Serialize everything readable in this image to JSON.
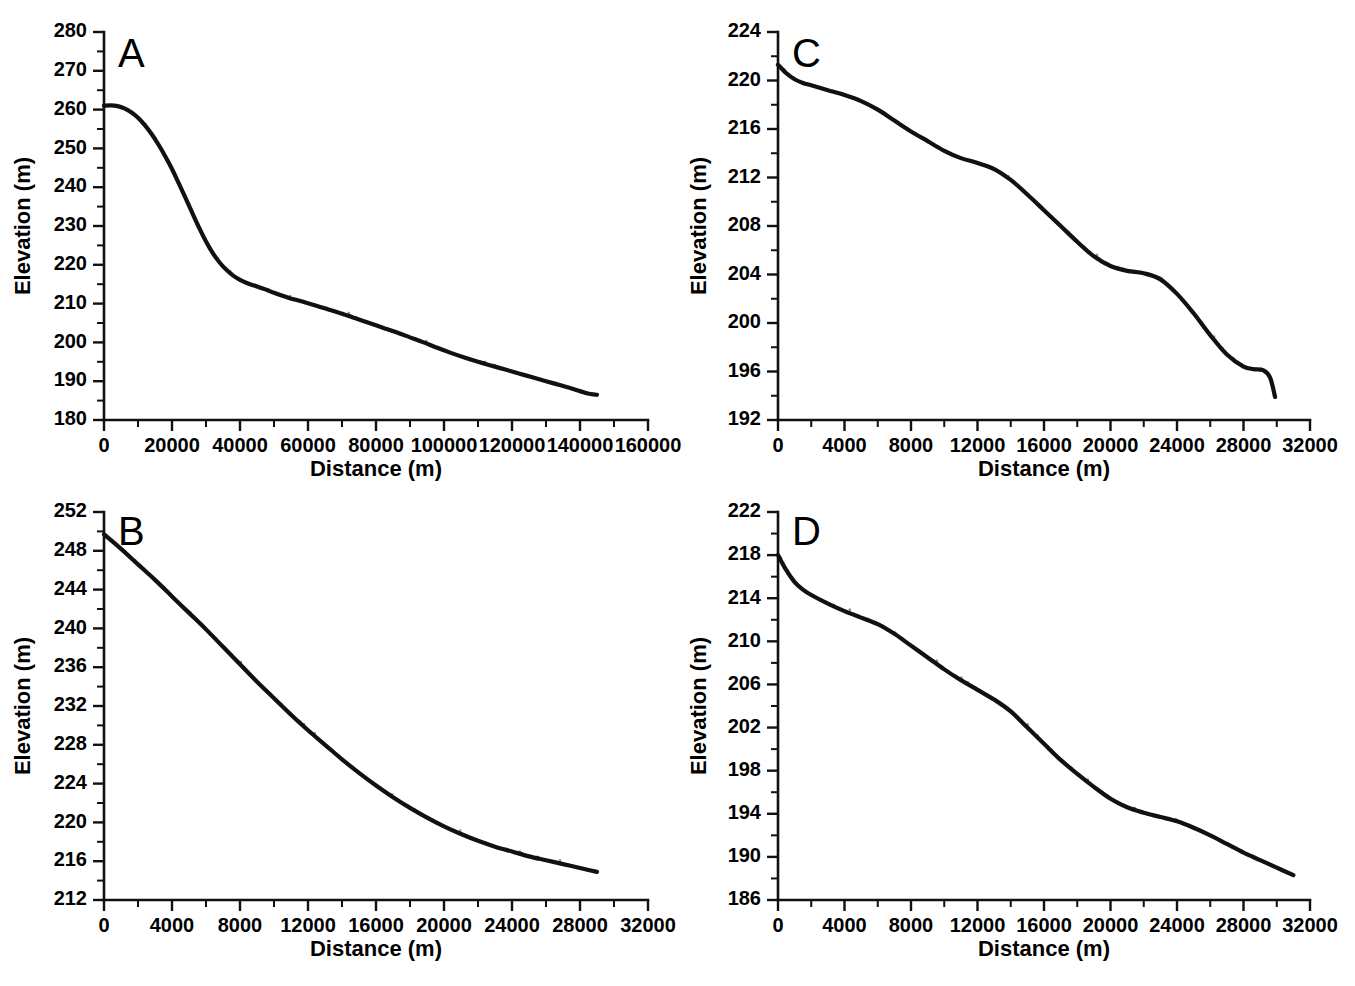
{
  "figure": {
    "panel_count": 4,
    "background_color": "#ffffff",
    "line_color": "#111111",
    "raw_trace_color": "#8a8a8a",
    "caption_partial": ""
  },
  "chart_data": [
    {
      "id": "A",
      "panel_letter": "A",
      "type": "line",
      "title": "",
      "xlabel": "Distance (m)",
      "ylabel": "Elevation (m)",
      "xlim": [
        0,
        160000
      ],
      "ylim": [
        180,
        280
      ],
      "xticks": [
        0,
        20000,
        40000,
        60000,
        80000,
        100000,
        120000,
        140000,
        160000
      ],
      "xtick_labels": [
        "0",
        "20000",
        "40000",
        "60000",
        "80000",
        "100000",
        "120000",
        "140000",
        "160000"
      ],
      "x_minor_step": 10000,
      "yticks": [
        180,
        190,
        200,
        210,
        220,
        230,
        240,
        250,
        260,
        270,
        280
      ],
      "ytick_labels": [
        "180",
        "190",
        "200",
        "210",
        "220",
        "230",
        "240",
        "250",
        "260",
        "270",
        "280"
      ],
      "y_minor_step": 5,
      "grid": false,
      "legend": "none",
      "series": [
        {
          "name": "smoothed longitudinal profile",
          "x": [
            0,
            2000,
            4000,
            6000,
            8000,
            10000,
            12000,
            14000,
            16000,
            18000,
            20000,
            22000,
            24000,
            26000,
            28000,
            30000,
            32000,
            34000,
            36000,
            38000,
            40000,
            42000,
            44000,
            46000,
            48000,
            50000,
            54000,
            58000,
            62000,
            66000,
            70000,
            74000,
            78000,
            82000,
            86000,
            90000,
            94000,
            98000,
            102000,
            106000,
            110000,
            114000,
            118000,
            122000,
            126000,
            130000,
            134000,
            138000,
            142000,
            145000
          ],
          "y": [
            261.0,
            261.1,
            260.9,
            260.3,
            259.3,
            257.9,
            256.0,
            253.7,
            251.0,
            248.0,
            244.7,
            241.0,
            237.2,
            233.3,
            229.5,
            226.0,
            223.0,
            220.6,
            218.7,
            217.2,
            216.1,
            215.3,
            214.7,
            214.1,
            213.5,
            212.8,
            211.6,
            210.6,
            209.6,
            208.5,
            207.4,
            206.2,
            205.0,
            203.8,
            202.6,
            201.3,
            200.0,
            198.6,
            197.3,
            196.1,
            195.0,
            194.0,
            193.0,
            192.0,
            191.0,
            190.0,
            189.0,
            188.0,
            186.9,
            186.5
          ]
        }
      ]
    },
    {
      "id": "B",
      "panel_letter": "B",
      "type": "line",
      "title": "",
      "xlabel": "Distance (m)",
      "ylabel": "Elevation (m)",
      "xlim": [
        0,
        32000
      ],
      "ylim": [
        212,
        252
      ],
      "xticks": [
        0,
        4000,
        8000,
        12000,
        16000,
        20000,
        24000,
        28000,
        32000
      ],
      "xtick_labels": [
        "0",
        "4000",
        "8000",
        "12000",
        "16000",
        "20000",
        "24000",
        "28000",
        "32000"
      ],
      "x_minor_step": 2000,
      "yticks": [
        212,
        216,
        220,
        224,
        228,
        232,
        236,
        240,
        244,
        248,
        252
      ],
      "ytick_labels": [
        "212",
        "216",
        "220",
        "224",
        "228",
        "232",
        "236",
        "240",
        "244",
        "248",
        "252"
      ],
      "y_minor_step": 2,
      "grid": false,
      "legend": "none",
      "series": [
        {
          "name": "smoothed longitudinal profile",
          "x": [
            0,
            1000,
            2000,
            3000,
            4000,
            5000,
            6000,
            7000,
            8000,
            9000,
            10000,
            11000,
            12000,
            13000,
            14000,
            15000,
            16000,
            17000,
            18000,
            19000,
            20000,
            21000,
            22000,
            23000,
            24000,
            25000,
            26000,
            27000,
            28000,
            29000
          ],
          "y": [
            249.7,
            248.2,
            246.6,
            245.0,
            243.3,
            241.6,
            239.9,
            238.1,
            236.3,
            234.5,
            232.8,
            231.1,
            229.5,
            228.0,
            226.5,
            225.1,
            223.8,
            222.6,
            221.5,
            220.5,
            219.6,
            218.8,
            218.1,
            217.5,
            217.0,
            216.5,
            216.1,
            215.7,
            215.3,
            214.9
          ]
        }
      ]
    },
    {
      "id": "C",
      "panel_letter": "C",
      "type": "line",
      "title": "",
      "xlabel": "Distance (m)",
      "ylabel": "Elevation (m)",
      "xlim": [
        0,
        32000
      ],
      "ylim": [
        192,
        224
      ],
      "xticks": [
        0,
        4000,
        8000,
        12000,
        16000,
        20000,
        24000,
        28000,
        32000
      ],
      "xtick_labels": [
        "0",
        "4000",
        "8000",
        "12000",
        "16000",
        "20000",
        "24000",
        "28000",
        "32000"
      ],
      "x_minor_step": 2000,
      "yticks": [
        192,
        196,
        200,
        204,
        208,
        212,
        216,
        220,
        224
      ],
      "ytick_labels": [
        "192",
        "196",
        "200",
        "204",
        "208",
        "212",
        "216",
        "220",
        "224"
      ],
      "y_minor_step": 2,
      "grid": false,
      "legend": "none",
      "series": [
        {
          "name": "smoothed longitudinal profile",
          "x": [
            0,
            500,
            1000,
            1500,
            2000,
            3000,
            4000,
            5000,
            6000,
            7000,
            8000,
            9000,
            10000,
            11000,
            12000,
            13000,
            14000,
            15000,
            16000,
            17000,
            18000,
            19000,
            20000,
            21000,
            22000,
            23000,
            24000,
            25000,
            26000,
            27000,
            28000,
            28600,
            29200,
            29600,
            29900
          ],
          "y": [
            221.3,
            220.6,
            220.1,
            219.8,
            219.6,
            219.2,
            218.8,
            218.3,
            217.6,
            216.7,
            215.8,
            215.0,
            214.2,
            213.6,
            213.2,
            212.7,
            211.8,
            210.6,
            209.3,
            208.0,
            206.7,
            205.5,
            204.7,
            204.3,
            204.1,
            203.6,
            202.4,
            200.8,
            199.0,
            197.4,
            196.4,
            196.2,
            196.1,
            195.5,
            193.9
          ]
        }
      ]
    },
    {
      "id": "D",
      "panel_letter": "D",
      "type": "line",
      "title": "",
      "xlabel": "Distance (m)",
      "ylabel": "Elevation (m)",
      "xlim": [
        0,
        32000
      ],
      "ylim": [
        186,
        222
      ],
      "xticks": [
        0,
        4000,
        8000,
        12000,
        16000,
        20000,
        24000,
        28000,
        32000
      ],
      "xtick_labels": [
        "0",
        "4000",
        "8000",
        "12000",
        "16000",
        "20000",
        "24000",
        "28000",
        "32000"
      ],
      "x_minor_step": 2000,
      "yticks": [
        186,
        190,
        194,
        198,
        202,
        206,
        210,
        214,
        218,
        222
      ],
      "ytick_labels": [
        "186",
        "190",
        "194",
        "198",
        "202",
        "206",
        "210",
        "214",
        "218",
        "222"
      ],
      "y_minor_step": 2,
      "grid": false,
      "legend": "none",
      "series": [
        {
          "name": "smoothed longitudinal profile",
          "x": [
            0,
            500,
            1000,
            1500,
            2000,
            3000,
            4000,
            5000,
            6000,
            7000,
            8000,
            9000,
            10000,
            11000,
            12000,
            13000,
            14000,
            15000,
            16000,
            17000,
            18000,
            19000,
            20000,
            21000,
            22000,
            23000,
            24000,
            25000,
            26000,
            27000,
            28000,
            29000,
            30000,
            31000
          ],
          "y": [
            218.0,
            216.6,
            215.5,
            214.8,
            214.3,
            213.5,
            212.8,
            212.2,
            211.6,
            210.7,
            209.6,
            208.5,
            207.4,
            206.4,
            205.5,
            204.6,
            203.5,
            202.0,
            200.5,
            199.0,
            197.7,
            196.5,
            195.4,
            194.6,
            194.1,
            193.7,
            193.3,
            192.7,
            192.0,
            191.2,
            190.4,
            189.7,
            189.0,
            188.3
          ]
        }
      ]
    }
  ]
}
